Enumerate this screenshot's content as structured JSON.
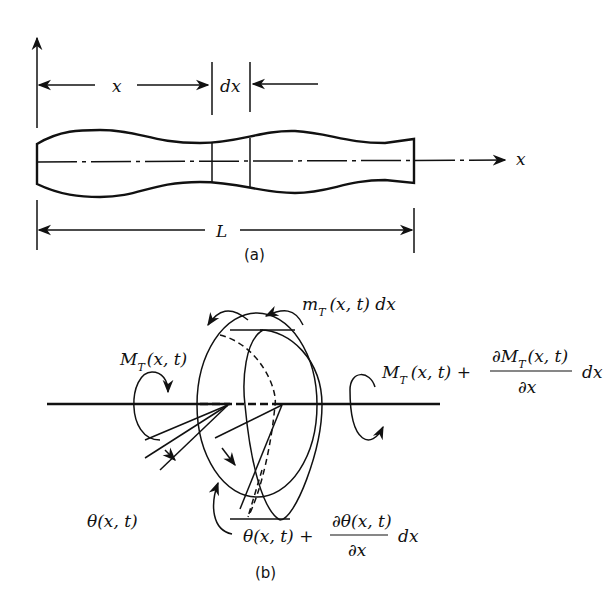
{
  "figure_a": {
    "caption": "(a)",
    "dim_x": "x",
    "dim_dx": "dx",
    "axis_x": "x",
    "dim_L": "L"
  },
  "figure_b": {
    "caption": "(b)",
    "distributed_torque": {
      "main": "m",
      "sub": "T",
      "rest": "(x, t) dx"
    },
    "left_moment": {
      "main": "M",
      "sub": "T",
      "rest": "(x, t)"
    },
    "right_moment": {
      "main": "M",
      "sub": "T",
      "rest": "(x, t) +",
      "frac_num_main": "∂M",
      "frac_num_sub": "T",
      "frac_num_rest": "(x, t)",
      "frac_den": "∂x",
      "tail": "dx"
    },
    "left_angle": "θ(x, t)",
    "right_angle": {
      "lead": "θ(x, t) +",
      "frac_num": "∂θ(x, t)",
      "frac_den": "∂x",
      "tail": "dx"
    }
  },
  "footer_fragment": "Figure 5.6"
}
